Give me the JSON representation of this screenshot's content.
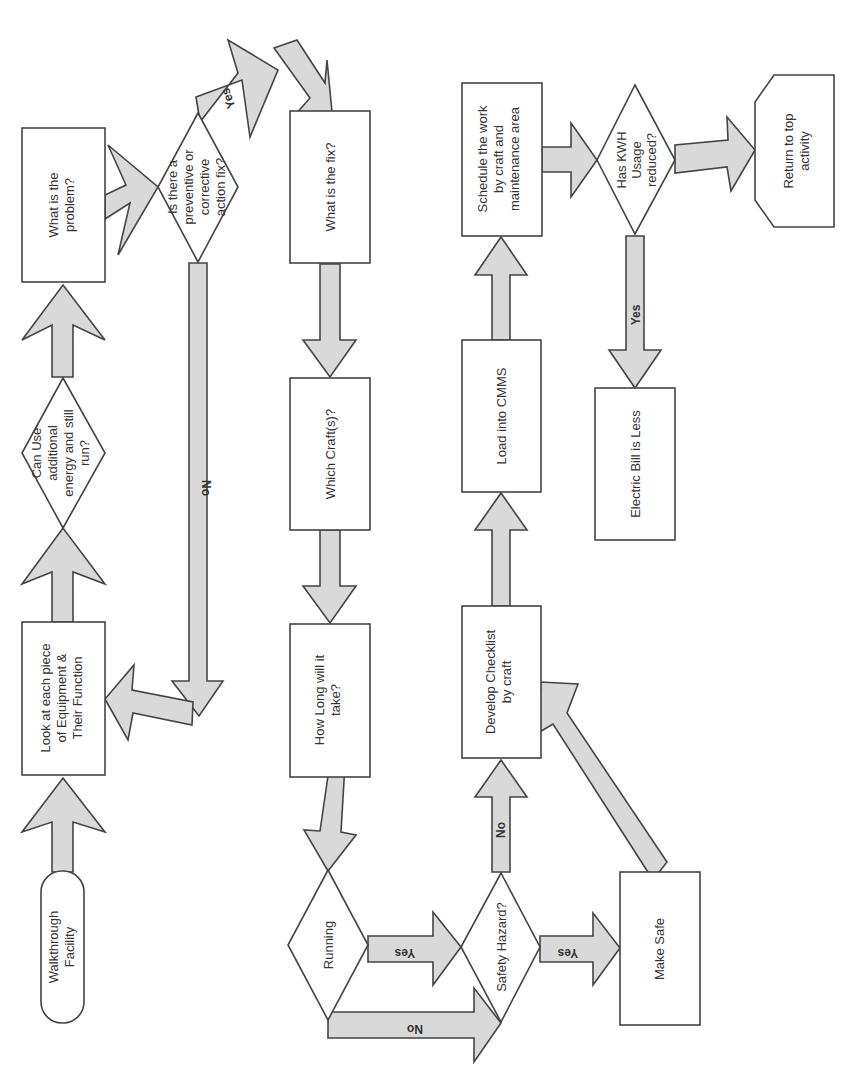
{
  "diagram": {
    "type": "flowchart",
    "orientation": "rotated-90-clockwise",
    "colors": {
      "node_fill": "#ffffff",
      "arrow_fill": "#d9d9d9",
      "stroke": "#444444",
      "text": "#333333"
    },
    "nodes": {
      "walkthrough": {
        "shape": "terminator",
        "lines": [
          "Walkthrough",
          "Facility"
        ]
      },
      "look": {
        "shape": "process",
        "lines": [
          "Look at each piece",
          "of Equipment &",
          "Their Function"
        ]
      },
      "can_use": {
        "shape": "decision",
        "lines": [
          "Can Use",
          "additional",
          "energy and still",
          "run?"
        ]
      },
      "problem": {
        "shape": "process",
        "lines": [
          "What is the",
          "problem?"
        ]
      },
      "is_there": {
        "shape": "decision",
        "lines": [
          "Is there a",
          "preventive or",
          "corrective",
          "action fix?"
        ]
      },
      "fix": {
        "shape": "process",
        "lines": [
          "What is the fix?"
        ]
      },
      "craft": {
        "shape": "process",
        "lines": [
          "Which Craft(s)?"
        ]
      },
      "how_long": {
        "shape": "process",
        "lines": [
          "How Long will it",
          "take?"
        ]
      },
      "running": {
        "shape": "decision",
        "lines": [
          "Running"
        ]
      },
      "safety": {
        "shape": "decision",
        "lines": [
          "Safety Hazard?"
        ]
      },
      "make_safe": {
        "shape": "process",
        "lines": [
          "Make Safe"
        ]
      },
      "checklist": {
        "shape": "process",
        "lines": [
          "Develop Checklist",
          "by craft"
        ]
      },
      "cmms": {
        "shape": "process",
        "lines": [
          "Load into CMMS"
        ]
      },
      "schedule": {
        "shape": "process",
        "lines": [
          "Schedule the work",
          "by craft and",
          "maintenance area"
        ]
      },
      "kwh": {
        "shape": "decision",
        "lines": [
          "Has KWH",
          "Usage",
          "reduced?"
        ]
      },
      "return": {
        "shape": "terminator",
        "lines": [
          "Return to top",
          "activity"
        ]
      },
      "bill": {
        "shape": "process",
        "lines": [
          "Electric Bill is Less"
        ]
      }
    },
    "edge_labels": {
      "is_there_yes": "Yes",
      "is_there_no": "No",
      "running_yes": "Yes",
      "running_no": "No",
      "safety_yes": "Yes",
      "safety_no": "No",
      "kwh_yes": "Yes"
    },
    "edges": [
      {
        "from": "walkthrough",
        "to": "look"
      },
      {
        "from": "look",
        "to": "can_use"
      },
      {
        "from": "can_use",
        "to": "problem"
      },
      {
        "from": "problem",
        "to": "is_there"
      },
      {
        "from": "is_there",
        "to": "fix",
        "label": "Yes"
      },
      {
        "from": "is_there",
        "to": "look",
        "label": "No"
      },
      {
        "from": "fix",
        "to": "craft"
      },
      {
        "from": "craft",
        "to": "how_long"
      },
      {
        "from": "how_long",
        "to": "running"
      },
      {
        "from": "running",
        "to": "safety",
        "label": "Yes"
      },
      {
        "from": "running",
        "to": "safety",
        "label": "No"
      },
      {
        "from": "safety",
        "to": "make_safe",
        "label": "Yes"
      },
      {
        "from": "safety",
        "to": "checklist",
        "label": "No"
      },
      {
        "from": "make_safe",
        "to": "checklist"
      },
      {
        "from": "checklist",
        "to": "cmms"
      },
      {
        "from": "cmms",
        "to": "schedule"
      },
      {
        "from": "schedule",
        "to": "kwh"
      },
      {
        "from": "kwh",
        "to": "return"
      },
      {
        "from": "kwh",
        "to": "bill",
        "label": "Yes"
      }
    ]
  }
}
